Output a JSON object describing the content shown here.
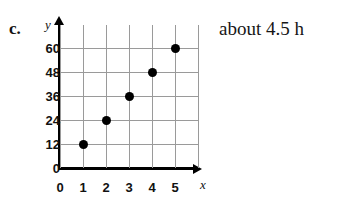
{
  "part_label": "c.",
  "answer": "about 4.5 h",
  "chart_data": {
    "type": "scatter",
    "title": "",
    "xlabel": "x",
    "ylabel": "y",
    "x": [
      1,
      2,
      3,
      4,
      5
    ],
    "values": [
      12,
      24,
      36,
      48,
      60
    ],
    "points": [
      {
        "x": 1,
        "y": 12
      },
      {
        "x": 2,
        "y": 24
      },
      {
        "x": 3,
        "y": 36
      },
      {
        "x": 4,
        "y": 48
      },
      {
        "x": 5,
        "y": 60
      }
    ],
    "x_ticks": [
      "0",
      "1",
      "2",
      "3",
      "4",
      "5"
    ],
    "y_ticks": [
      "0",
      "12",
      "24",
      "36",
      "48",
      "60"
    ],
    "xlim": [
      0,
      5
    ],
    "ylim": [
      0,
      60
    ],
    "grid": true,
    "legend": "none",
    "marker_color": "#000000",
    "grid_color": "#9a9a9a",
    "axis_color": "#000000"
  }
}
